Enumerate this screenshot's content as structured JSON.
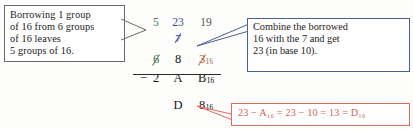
{
  "figure": {
    "accent_colors": {
      "left_box_border": "#6a6a68",
      "right_box_border": "#4b5e91",
      "red_box": "#d9604f",
      "borrow_green": "#3f7a4e",
      "borrow_blue": "#3a4e93",
      "borrow_gray": "#55565a",
      "digit_rust": "#b4622f",
      "ink_black": "#161616"
    }
  },
  "callout_left": {
    "lines": [
      "Borrowing 1 group",
      "of 16 from 6 groups",
      "of 16 leaves",
      "5 groups of 16."
    ]
  },
  "callout_right": {
    "lines": [
      "Combine the borrowed",
      "16 with the 7 and get",
      "23 (in base 10)."
    ]
  },
  "callout_red": {
    "equation": "23 − A₁₆ = 23 − 10 = 13 = D₁₆",
    "parts": {
      "lhs": "23",
      "minus1": "−",
      "term_hex": "A",
      "term_hex_sub": "16",
      "equals1": "=",
      "dec_lhs": "23",
      "minus2": "−",
      "dec_rhs": "10",
      "equals2": "=",
      "result_dec": "13",
      "equals3": "=",
      "result_hex": "D",
      "result_hex_sub": "16"
    }
  },
  "worksheet": {
    "borrow_row": {
      "col1": "5",
      "col2": "23",
      "col3": "19"
    },
    "seven_row": {
      "col2": "7"
    },
    "minuend": {
      "op": "",
      "col1": "6",
      "col2": "8",
      "col3": "3",
      "col3_sub": "16"
    },
    "subtrahend": {
      "op": "−",
      "col1": "2",
      "col2": "A",
      "col3": "B",
      "col3_sub": "16"
    },
    "answer": {
      "col1": "",
      "col2": "D",
      "col3": "8",
      "col3_sub": "16"
    }
  }
}
